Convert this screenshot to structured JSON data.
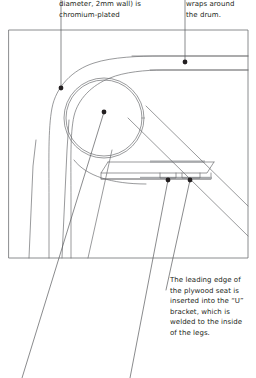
{
  "page": {
    "background": "#ffffff",
    "ink": "#231f20",
    "line_color": "#6d6e71",
    "width": 256,
    "height": 378
  },
  "annotations": {
    "top_left": {
      "id": "note-chromium-plated",
      "text": "diameter, 2mm wall) is\nchromium-plated",
      "leader_dot": {
        "x": 61,
        "y": 88
      }
    },
    "top_right": {
      "id": "note-wraps-around-drum",
      "text": "wraps around\nthe drum.",
      "leader_dot": {
        "x": 185,
        "y": 62
      }
    },
    "bottom": {
      "id": "note-u-bracket",
      "text": "The leading edge of\nthe plywood seat is\ninserted into the “U”\nbracket, which is\nwelded to the inside\nof the legs.",
      "leader_dots": [
        {
          "x": 168,
          "y": 180
        },
        {
          "x": 190,
          "y": 180
        }
      ]
    }
  },
  "drawing": {
    "frame": {
      "x": 9,
      "y": 30,
      "width": 239,
      "height": 228
    },
    "parts": [
      {
        "name": "drum-outer-circle",
        "cx": 104,
        "cy": 118,
        "r": 40
      },
      {
        "name": "drum-inner-circle",
        "cx": 104,
        "cy": 118,
        "r": 38
      },
      {
        "name": "wrap-arm-outer-curve"
      },
      {
        "name": "wrap-arm-inner-curve"
      },
      {
        "name": "plywood-seat-upper-edge"
      },
      {
        "name": "plywood-seat-lower-edge"
      },
      {
        "name": "u-bracket-left"
      },
      {
        "name": "u-bracket-right"
      },
      {
        "name": "leg-front-left"
      },
      {
        "name": "leg-rear-left"
      },
      {
        "name": "leg-diagonal-right"
      }
    ]
  }
}
